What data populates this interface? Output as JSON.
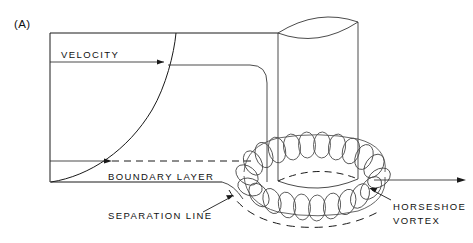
{
  "figure": {
    "panel_label": "(A)",
    "type": "technical-line-diagram",
    "background_color": "#ffffff",
    "line_color": "#1a1a1a",
    "coil_color": "#4a4a4a"
  },
  "labels": {
    "velocity": "VELOCITY",
    "boundary_layer": "BOUNDARY  LAYER",
    "separation_line": "SEPARATION  LINE",
    "horseshoe_vortex_line1": "HORSESHOE",
    "horseshoe_vortex_line2": "VORTEX"
  },
  "geometry": {
    "wall_x": 50,
    "top_frame_y": 33,
    "ground_y": 182,
    "velocity_arrow_y": 62,
    "boundary_layer_y": 161,
    "cylinder_left_x": 278,
    "cylinder_right_x": 358,
    "cylinder_top_y": 22,
    "cylinder_base_y": 180,
    "vortex_ring_center_x": 318,
    "vortex_ring_center_y": 172,
    "outflow_arrow_y": 180,
    "outflow_arrow_end_x": 465
  }
}
